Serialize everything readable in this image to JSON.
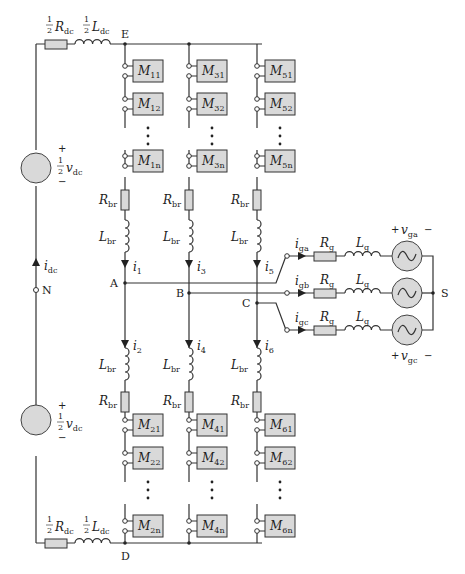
{
  "diagram": {
    "type": "Modular Multilevel Converter (MMC) circuit",
    "nodes": {
      "E": "E",
      "D": "D",
      "N": "N",
      "A": "A",
      "B": "B",
      "C": "C",
      "S": "S"
    },
    "dc_side": {
      "top_resistor": {
        "coef": "1",
        "den": "2",
        "sym": "R",
        "sub": "dc"
      },
      "top_inductor": {
        "coef": "1",
        "den": "2",
        "sym": "L",
        "sub": "dc"
      },
      "bottom_resistor": {
        "coef": "1",
        "den": "2",
        "sym": "R",
        "sub": "dc"
      },
      "bottom_inductor": {
        "coef": "1",
        "den": "2",
        "sym": "L",
        "sub": "dc"
      },
      "top_source": {
        "plus": "+",
        "minus": "−",
        "coef": "1",
        "den": "2",
        "sym": "v",
        "sub": "dc"
      },
      "bottom_source": {
        "plus": "+",
        "minus": "−",
        "coef": "1",
        "den": "2",
        "sym": "v",
        "sub": "dc"
      },
      "current": {
        "sym": "i",
        "sub": "dc"
      }
    },
    "arms": {
      "upper": [
        {
          "modules": [
            {
              "sym": "M",
              "sub": "11"
            },
            {
              "sym": "M",
              "sub": "12"
            },
            {
              "sym": "M",
              "sub": "1n"
            }
          ],
          "R": {
            "sym": "R",
            "sub": "br"
          },
          "L": {
            "sym": "L",
            "sub": "br"
          },
          "current": {
            "sym": "i",
            "sub": "1"
          }
        },
        {
          "modules": [
            {
              "sym": "M",
              "sub": "31"
            },
            {
              "sym": "M",
              "sub": "32"
            },
            {
              "sym": "M",
              "sub": "3n"
            }
          ],
          "R": {
            "sym": "R",
            "sub": "br"
          },
          "L": {
            "sym": "L",
            "sub": "br"
          },
          "current": {
            "sym": "i",
            "sub": "3"
          }
        },
        {
          "modules": [
            {
              "sym": "M",
              "sub": "51"
            },
            {
              "sym": "M",
              "sub": "52"
            },
            {
              "sym": "M",
              "sub": "5n"
            }
          ],
          "R": {
            "sym": "R",
            "sub": "br"
          },
          "L": {
            "sym": "L",
            "sub": "br"
          },
          "current": {
            "sym": "i",
            "sub": "5"
          }
        }
      ],
      "lower": [
        {
          "modules": [
            {
              "sym": "M",
              "sub": "21"
            },
            {
              "sym": "M",
              "sub": "22"
            },
            {
              "sym": "M",
              "sub": "2n"
            }
          ],
          "R": {
            "sym": "R",
            "sub": "br"
          },
          "L": {
            "sym": "L",
            "sub": "br"
          },
          "current": {
            "sym": "i",
            "sub": "2"
          }
        },
        {
          "modules": [
            {
              "sym": "M",
              "sub": "41"
            },
            {
              "sym": "M",
              "sub": "42"
            },
            {
              "sym": "M",
              "sub": "4n"
            }
          ],
          "R": {
            "sym": "R",
            "sub": "br"
          },
          "L": {
            "sym": "L",
            "sub": "br"
          },
          "current": {
            "sym": "i",
            "sub": "4"
          }
        },
        {
          "modules": [
            {
              "sym": "M",
              "sub": "61"
            },
            {
              "sym": "M",
              "sub": "62"
            },
            {
              "sym": "M",
              "sub": "6n"
            }
          ],
          "R": {
            "sym": "R",
            "sub": "br"
          },
          "L": {
            "sym": "L",
            "sub": "br"
          },
          "current": {
            "sym": "i",
            "sub": "6"
          }
        }
      ]
    },
    "grid": [
      {
        "current": {
          "sym": "i",
          "sub": "ga"
        },
        "R": {
          "sym": "R",
          "sub": "g"
        },
        "L": {
          "sym": "L",
          "sub": "g"
        }
      },
      {
        "current": {
          "sym": "i",
          "sub": "gb"
        },
        "R": {
          "sym": "R",
          "sub": "g"
        },
        "L": {
          "sym": "L",
          "sub": "g"
        }
      },
      {
        "current": {
          "sym": "i",
          "sub": "gc"
        },
        "R": {
          "sym": "R",
          "sub": "g"
        },
        "L": {
          "sym": "L",
          "sub": "g"
        }
      }
    ],
    "grid_voltages": {
      "top": {
        "plus": "+",
        "minus": "−",
        "sym": "v",
        "sub": "ga"
      },
      "bottom": {
        "plus": "+",
        "minus": "−",
        "sym": "v",
        "sub": "gc"
      }
    },
    "colors": {
      "component_fill": "#d9d9d9",
      "wire": "#333333"
    }
  }
}
